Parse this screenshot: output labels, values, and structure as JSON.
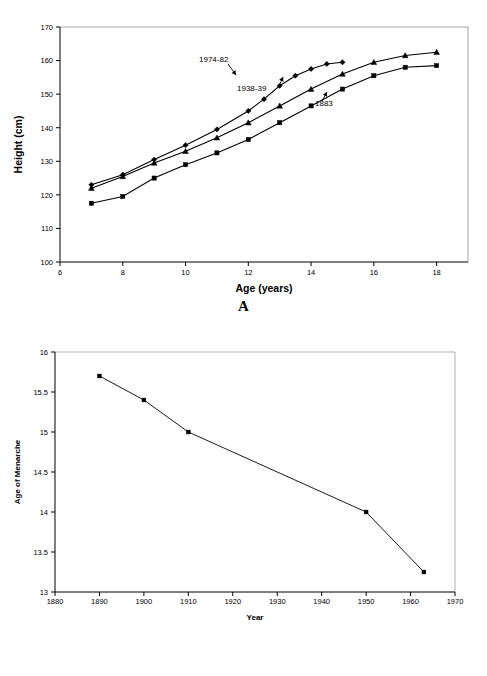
{
  "figure": {
    "panel_a_letter": "A",
    "panel_b_letter": "B"
  },
  "chart_data": [
    {
      "id": "panel_a",
      "type": "line",
      "title": "",
      "xlabel": "Age (years)",
      "ylabel": "Height (cm)",
      "xlim": [
        6,
        19
      ],
      "ylim": [
        100,
        170
      ],
      "xticks": [
        6,
        8,
        10,
        12,
        14,
        16,
        18
      ],
      "xtick_labels": [
        "6",
        "8",
        "10",
        "12",
        "14",
        "16",
        "18"
      ],
      "yticks": [
        100,
        110,
        120,
        130,
        140,
        150,
        160,
        170
      ],
      "ytick_labels": [
        "100",
        "110",
        "120",
        "130",
        "140",
        "150",
        "160",
        "170"
      ],
      "grid": false,
      "legend": "annotations-inline",
      "annotations": [
        {
          "text": "1974-82",
          "x_px": 199,
          "y_px": 62
        },
        {
          "text": "1938-39",
          "x_px": 237,
          "y_px": 91
        },
        {
          "text": "1883",
          "x_px": 315,
          "y_px": 106
        }
      ],
      "series": [
        {
          "name": "1974-82",
          "marker": "diamond",
          "x": [
            7,
            8,
            9,
            10,
            11,
            12,
            12.5,
            13,
            13.5,
            14,
            14.5,
            15
          ],
          "values": [
            123.0,
            126.0,
            130.5,
            134.8,
            139.5,
            145.0,
            148.5,
            152.5,
            155.5,
            157.5,
            159.0,
            159.5
          ]
        },
        {
          "name": "1938-39",
          "marker": "triangle",
          "x": [
            7,
            8,
            9,
            10,
            11,
            12,
            13,
            14,
            15,
            16,
            17,
            18
          ],
          "values": [
            122.0,
            125.5,
            129.5,
            133.0,
            137.0,
            141.5,
            146.5,
            151.5,
            156.0,
            159.5,
            161.5,
            162.5
          ]
        },
        {
          "name": "1883",
          "marker": "square",
          "x": [
            7,
            8,
            9,
            10,
            11,
            12,
            13,
            14,
            15,
            16,
            17,
            18
          ],
          "values": [
            117.5,
            119.5,
            125.0,
            129.0,
            132.5,
            136.5,
            141.5,
            146.5,
            151.5,
            155.5,
            158.0,
            158.5
          ]
        }
      ]
    },
    {
      "id": "panel_b",
      "type": "line",
      "title": "",
      "xlabel": "Year",
      "ylabel": "Age of Menarche",
      "xlim": [
        1880,
        1970
      ],
      "ylim": [
        13,
        16
      ],
      "xticks": [
        1880,
        1890,
        1900,
        1910,
        1920,
        1930,
        1940,
        1950,
        1960,
        1970
      ],
      "xtick_labels": [
        "1880",
        "1890",
        "1900",
        "1910",
        "1920",
        "1930",
        "1940",
        "1950",
        "1960",
        "1970"
      ],
      "yticks": [
        13,
        13.5,
        14,
        14.5,
        15,
        15.5,
        16
      ],
      "ytick_labels": [
        "13",
        "13.5",
        "14",
        "14.5",
        "15",
        "15.5",
        "16"
      ],
      "grid": false,
      "series": [
        {
          "name": "Age of Menarche",
          "marker": "square",
          "x": [
            1890,
            1900,
            1910,
            1950,
            1963
          ],
          "values": [
            15.7,
            15.4,
            15.0,
            14.0,
            13.25
          ]
        }
      ]
    }
  ]
}
